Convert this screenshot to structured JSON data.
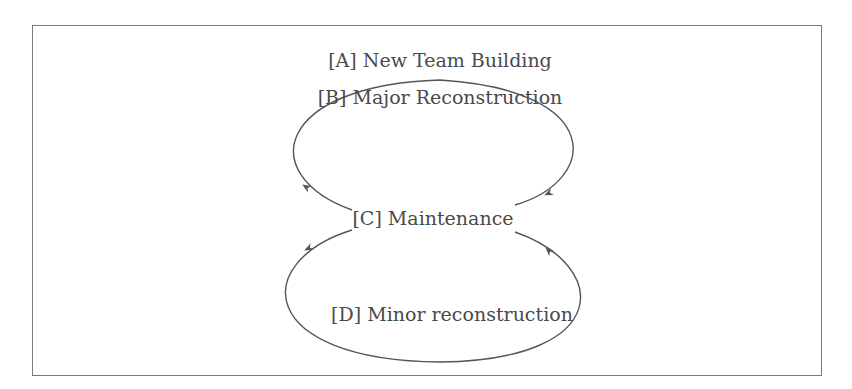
{
  "diagram": {
    "title": "",
    "nodes": [
      {
        "id": "A",
        "label": "[A] New Team Building"
      },
      {
        "id": "B",
        "label": "[B] Major Reconstruction"
      },
      {
        "id": "C",
        "label": "[C] Maintenance"
      },
      {
        "id": "D",
        "label": "[D] Minor reconstruction"
      }
    ],
    "edges": [
      {
        "from": "C",
        "to": "B",
        "shape": "upper-loop-left",
        "arrow_direction": "into C side from B"
      },
      {
        "from": "B",
        "to": "C",
        "shape": "upper-loop-right"
      },
      {
        "from": "C",
        "to": "D",
        "shape": "lower-loop-left"
      },
      {
        "from": "D",
        "to": "C",
        "shape": "lower-loop-right"
      }
    ],
    "colors": {
      "line": "#555555",
      "text": "#4a4a4a",
      "frame": "#7a7a7a"
    }
  }
}
